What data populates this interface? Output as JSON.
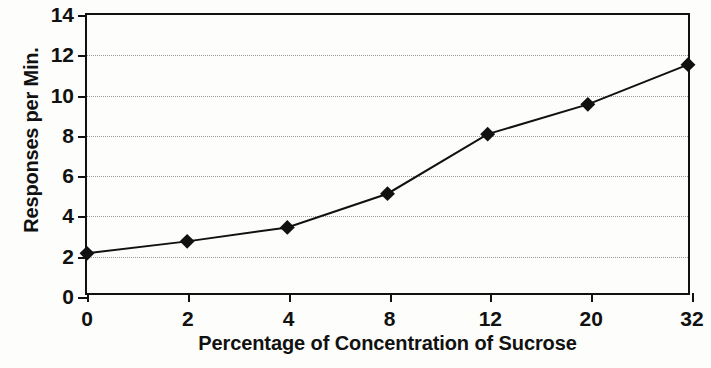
{
  "chart_data": {
    "type": "line",
    "title": "",
    "xlabel": "Percentage of Concentration of Sucrose",
    "ylabel": "Responses per Min.",
    "categories": [
      "0",
      "2",
      "4",
      "8",
      "12",
      "20",
      "32"
    ],
    "x": [
      0,
      2,
      4,
      8,
      12,
      20,
      32
    ],
    "values": [
      2.0,
      2.6,
      3.3,
      5.0,
      8.0,
      9.5,
      11.5
    ],
    "series": [
      {
        "name": "Responses per Min.",
        "values": [
          2.0,
          2.6,
          3.3,
          5.0,
          8.0,
          9.5,
          11.5
        ],
        "marker": "filled-diamond",
        "color": "#111111"
      }
    ],
    "x_axis_scale": "categorical",
    "xtick_labels": [
      "0",
      "2",
      "4",
      "8",
      "12",
      "20",
      "32"
    ],
    "ytick_labels": [
      "0",
      "2",
      "4",
      "6",
      "8",
      "10",
      "12",
      "14"
    ],
    "yticks": [
      0,
      2,
      4,
      6,
      8,
      10,
      12,
      14
    ],
    "ylim": [
      0,
      14
    ],
    "gridlines": {
      "horizontal": [
        2,
        4,
        6,
        8,
        10,
        12
      ],
      "vertical": [],
      "style": "dotted",
      "color": "#9a9a9a"
    },
    "legend": {
      "visible": false,
      "position": "none",
      "entries": []
    },
    "frame": {
      "box": true,
      "color": "#111111"
    },
    "background": "#fdfdfb",
    "annotations": []
  }
}
